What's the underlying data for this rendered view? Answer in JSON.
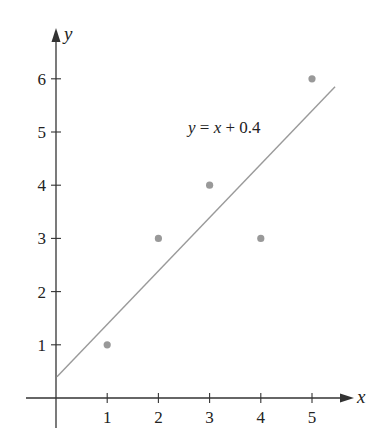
{
  "chart_data": {
    "type": "scatter",
    "title": "",
    "xlabel": "x",
    "ylabel": "y",
    "xlim": [
      0,
      5.5
    ],
    "ylim": [
      0,
      6.5
    ],
    "grid": false,
    "x_ticks": [
      1,
      2,
      3,
      4,
      5
    ],
    "y_ticks": [
      1,
      2,
      3,
      4,
      5,
      6
    ],
    "points": [
      {
        "x": 1,
        "y": 1
      },
      {
        "x": 2,
        "y": 3
      },
      {
        "x": 3,
        "y": 4
      },
      {
        "x": 4,
        "y": 3
      },
      {
        "x": 5,
        "y": 6
      }
    ],
    "fit_line": {
      "equation_label": "y = x + 0.4",
      "slope": 1,
      "intercept": 0.4,
      "x_range": [
        0,
        5.45
      ]
    },
    "annotations": [
      "y = x + 0.4"
    ],
    "colors": {
      "axis": "#333333",
      "points": "#999999",
      "line": "#9a9a9a"
    }
  }
}
